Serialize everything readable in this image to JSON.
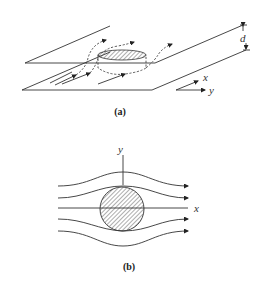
{
  "figure": {
    "panel_a": {
      "caption": "(a)",
      "labels": {
        "gap": "d",
        "axis_x": "x",
        "axis_y": "y"
      }
    },
    "panel_b": {
      "caption": "(b)",
      "labels": {
        "axis_x": "x",
        "axis_y": "y"
      }
    }
  }
}
